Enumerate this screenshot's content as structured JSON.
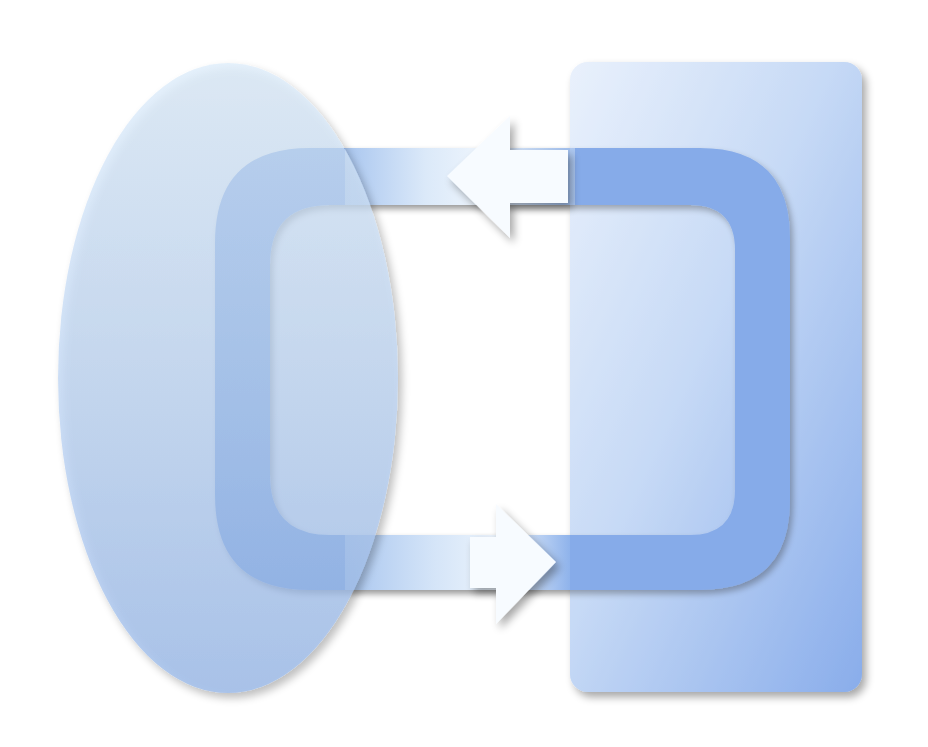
{
  "diagram": {
    "type": "cycle-exchange",
    "nodes": [
      {
        "id": "left-entity",
        "shape": "ellipse",
        "label": ""
      },
      {
        "id": "right-entity",
        "shape": "rounded-rectangle",
        "label": ""
      }
    ],
    "edges": [
      {
        "from": "right-entity",
        "to": "left-entity",
        "position": "top",
        "direction": "left"
      },
      {
        "from": "left-entity",
        "to": "right-entity",
        "position": "bottom",
        "direction": "right"
      }
    ],
    "colors": {
      "background": "#ffffff",
      "ellipse_light": "#dcebfa",
      "ellipse_dark": "#9fbfec",
      "rect_light": "#eef5fd",
      "rect_dark": "#6f9be6",
      "loop": "#6a97e2",
      "arrow": "#f7fbff",
      "shadow": "#6d7a94"
    }
  }
}
